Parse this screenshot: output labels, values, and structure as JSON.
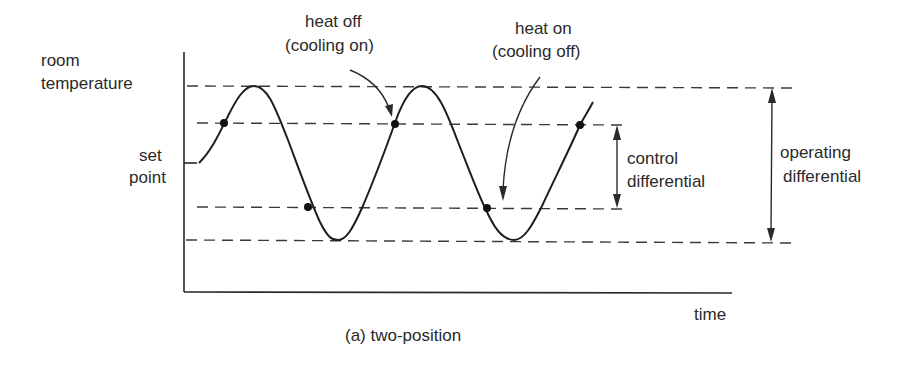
{
  "diagram": {
    "caption": "(a) two-position",
    "y_axis_label": {
      "line1": "room",
      "line2": "temperature"
    },
    "set_point_label": {
      "line1": "set",
      "line2": "point"
    },
    "x_axis_label": "time",
    "annotations": {
      "heat_off": {
        "line1": "heat off",
        "line2": "(cooling on)"
      },
      "heat_on": {
        "line1": "heat on",
        "line2": "(cooling off)"
      }
    },
    "dimensions": {
      "control_differential": {
        "line1": "control",
        "line2": "differential"
      },
      "operating_differential": {
        "line1": "operating",
        "line2": "differential"
      }
    },
    "levels": [
      "upper operating limit",
      "control upper (heat off)",
      "set point",
      "control lower (heat on)",
      "lower operating limit"
    ],
    "switch_points": [
      {
        "event": "heat off",
        "level": "control upper"
      },
      {
        "event": "heat on",
        "level": "control lower"
      },
      {
        "event": "heat off",
        "level": "control upper"
      },
      {
        "event": "heat on",
        "level": "control lower"
      },
      {
        "event": "heat off",
        "level": "control upper"
      }
    ],
    "colors": {
      "line": "#1e1e1e",
      "text": "#2a2a2a",
      "background": "#ffffff"
    }
  }
}
